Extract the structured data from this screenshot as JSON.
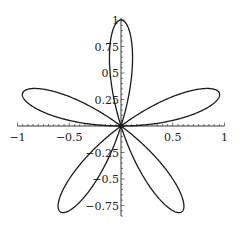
{
  "chart_data": {
    "type": "line",
    "title": "",
    "xlabel": "",
    "ylabel": "",
    "equation": "r = sin(5*theta)",
    "xlim": [
      -1,
      1
    ],
    "ylim": [
      -0.85,
      1
    ],
    "grid": false,
    "legend": null,
    "x_ticks": [
      {
        "value": -1,
        "label": "-1"
      },
      {
        "value": -0.5,
        "label": "-0.5"
      },
      {
        "value": 0.5,
        "label": "0.5"
      },
      {
        "value": 1,
        "label": "1"
      }
    ],
    "y_ticks": [
      {
        "value": 1,
        "label": "1"
      },
      {
        "value": 0.75,
        "label": "0.75"
      },
      {
        "value": 0.5,
        "label": "0.5"
      },
      {
        "value": 0.25,
        "label": "0.25"
      },
      {
        "value": -0.25,
        "label": "-0.25"
      },
      {
        "value": -0.5,
        "label": "-0.5"
      },
      {
        "value": -0.75,
        "label": "-0.75"
      }
    ],
    "petal_tips": [
      {
        "x": 0,
        "y": 1
      },
      {
        "x": 0.951,
        "y": 0.309
      },
      {
        "x": 0.588,
        "y": -0.809
      },
      {
        "x": -0.588,
        "y": -0.809
      },
      {
        "x": -0.951,
        "y": 0.309
      }
    ],
    "stroke_color": "#1a1a1a"
  }
}
